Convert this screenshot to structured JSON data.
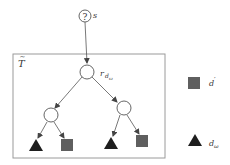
{
  "diagram": {
    "type": "tree",
    "source_node": {
      "symbol": "?",
      "label": "s"
    },
    "container": {
      "label": "T",
      "label_accent": "~"
    },
    "root": {
      "label_main": "r",
      "label_sub": "d",
      "label_subsub": "ω"
    },
    "internal_nodes": [
      "left-child",
      "right-child"
    ],
    "leaves": [
      {
        "parent": "left-child",
        "shape": "triangle"
      },
      {
        "parent": "left-child",
        "shape": "square"
      },
      {
        "parent": "right-child",
        "shape": "triangle"
      },
      {
        "parent": "right-child",
        "shape": "square"
      }
    ],
    "legend": [
      {
        "shape": "square",
        "label_main": "d",
        "label_prime": "′"
      },
      {
        "shape": "triangle",
        "label_main": "d",
        "label_sub": "ω"
      }
    ],
    "colors": {
      "line": "#555555",
      "box": "#999999",
      "square_fill": "#5f5f5f",
      "triangle_fill": "#1e1e1e"
    }
  }
}
